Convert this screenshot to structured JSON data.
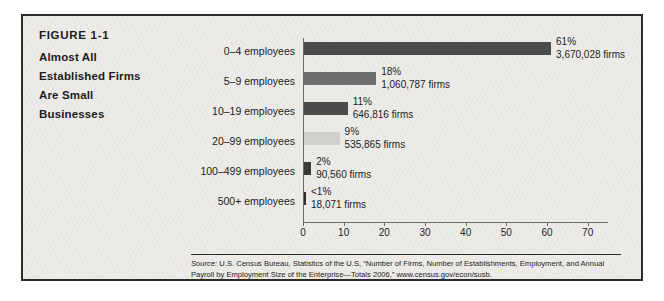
{
  "figure": {
    "number": "FIGURE 1-1",
    "title_lines": [
      "Almost All",
      "Established Firms",
      "Are Small",
      "Businesses"
    ]
  },
  "source": {
    "label": "Source:",
    "text": " U.S. Census Bureau, Statistics of the U.S, “Number of Firms, Number of Establishments, Employment, and Annual Payroll by Employment Size of the Enterprise—Totals 2006,” www.census.gov/econ/susb."
  },
  "chart_data": {
    "type": "bar",
    "orientation": "horizontal",
    "title": "Almost All Established Firms Are Small Businesses",
    "xlabel": "",
    "ylabel": "",
    "xlim": [
      0,
      75
    ],
    "xticks": [
      0,
      10,
      20,
      30,
      40,
      50,
      60,
      70
    ],
    "grid": false,
    "legend": "none",
    "categories": [
      "0–4 employees",
      "5–9 employees",
      "10–19 employees",
      "20–99 employees",
      "100–499 employees",
      "500+ employees"
    ],
    "values": [
      61,
      18,
      11,
      9,
      2,
      0.6
    ],
    "percent_labels": [
      "61%",
      "18%",
      "11%",
      "9%",
      "2%",
      "<1%"
    ],
    "firm_labels": [
      "3,670,028 firms",
      "1,060,787 firms",
      "646,816 firms",
      "535,865 firms",
      "90,560 firms",
      "18,071 firms"
    ],
    "bar_colors": [
      "#4b4b4b",
      "#6e6e6e",
      "#4b4b4b",
      "#d2d0cd",
      "#3a3a3a",
      "#2e2e2e"
    ]
  },
  "colors": {
    "card_background": "#eeece9",
    "card_border": "#2b2b2b",
    "text": "#1c1c1c",
    "axis": "#6d6a66"
  }
}
